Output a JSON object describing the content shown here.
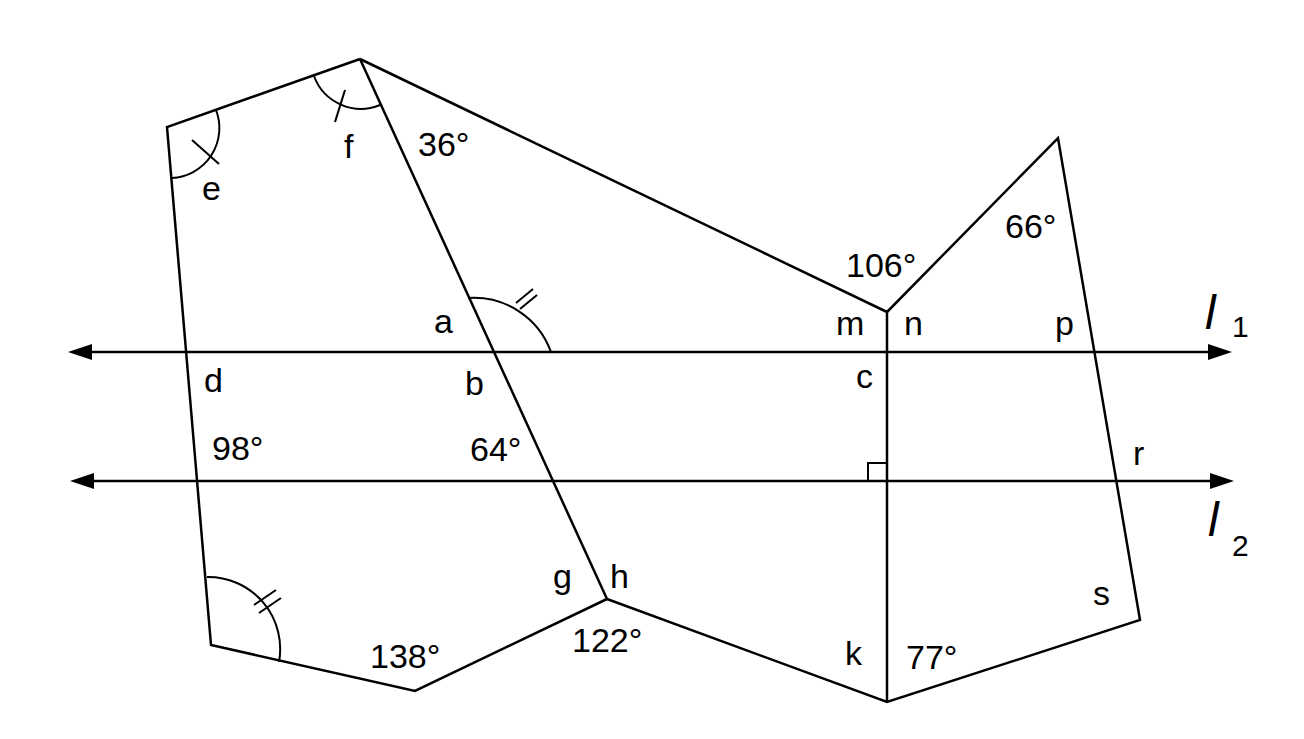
{
  "diagram": {
    "lines": {
      "l1": {
        "name": "l",
        "subscript": "1"
      },
      "l2": {
        "name": "l",
        "subscript": "2"
      }
    },
    "given_angles": {
      "top_vertex": "36°",
      "n_top": "106°",
      "right_apex": "66°",
      "left_between": "98°",
      "transversal_between": "64°",
      "bottom_left": "138°",
      "h_bottom": "122°",
      "k_bottom": "77°"
    },
    "unknown_angles": {
      "a": "a",
      "b": "b",
      "c": "c",
      "d": "d",
      "e": "e",
      "f": "f",
      "g": "g",
      "h": "h",
      "k": "k",
      "m": "m",
      "n": "n",
      "p": "p",
      "r": "r",
      "s": "s"
    },
    "marks": {
      "single_tick_pair": [
        "e",
        "f"
      ],
      "double_tick_pair": [
        "angle above l1 at transversal",
        "bottom-left angle"
      ],
      "right_angle": "at line c–k with l2"
    }
  }
}
